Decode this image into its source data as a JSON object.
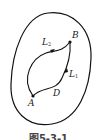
{
  "figure": {
    "region_label": "D",
    "points": [
      {
        "name": "A",
        "x": 33,
        "y": 96
      },
      {
        "name": "B",
        "x": 70,
        "y": 42
      }
    ],
    "curves": [
      {
        "name": "L",
        "subscript": "2",
        "desc": "upper-left path from A to B"
      },
      {
        "name": "L",
        "subscript": "1",
        "desc": "lower-right path from A to B"
      }
    ],
    "caption": "图5-3-1",
    "colors": {
      "stroke": "#111111",
      "background": "#ffffff",
      "text": "#222222"
    }
  }
}
